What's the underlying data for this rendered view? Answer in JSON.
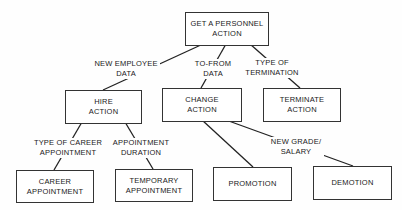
{
  "nodes": {
    "root": "GET A PERSONNEL\nACTION",
    "hire": "HIRE\nACTION",
    "change": "CHANGE\nACTION",
    "terminate": "TERMINATE\nACTION",
    "career": "CAREER\nAPPOINTMENT",
    "temporary": "TEMPORARY\nAPPOINTMENT",
    "promotion": "PROMOTION",
    "demotion": "DEMOTION"
  },
  "edges": {
    "root_hire": "NEW EMPLOYEE\nDATA",
    "root_change": "TO-FROM\nDATA",
    "root_terminate": "TYPE OF\nTERMINATION",
    "hire_career": "TYPE OF CAREER\nAPPOINTMENT",
    "hire_temporary": "APPOINTMENT\nDURATION",
    "change_grade": "NEW GRADE/\nSALARY"
  }
}
